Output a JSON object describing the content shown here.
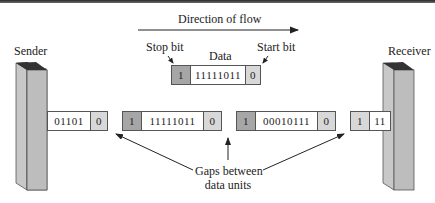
{
  "flow": {
    "label": "Direction of flow"
  },
  "sender": {
    "label": "Sender"
  },
  "receiver": {
    "label": "Receiver"
  },
  "legend_frame": {
    "stop_bit_label": "Stop bit",
    "data_label": "Data",
    "start_bit_label": "Start bit",
    "stop": "1",
    "data": "11111011",
    "start": "0"
  },
  "stream": [
    {
      "data": "01101",
      "start": "0"
    },
    {
      "stop": "1",
      "data": "11111011",
      "start": "0"
    },
    {
      "stop": "1",
      "data": "00010111",
      "start": "0"
    },
    {
      "stop": "1",
      "data": "11"
    }
  ],
  "gaps_label_line1": "Gaps between",
  "gaps_label_line2": "data units",
  "colors": {
    "stop_bit": "#a6a6a6",
    "start_bit": "#d8d8d8",
    "device_face": "#bdbdbd",
    "device_top": "#333333",
    "line": "#222222"
  }
}
